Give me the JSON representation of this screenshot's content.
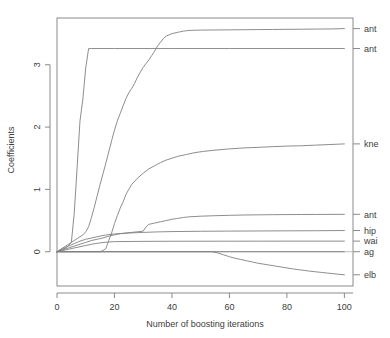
{
  "chart_data": {
    "type": "line",
    "title": "",
    "xlabel": "Number of boosting iterations",
    "ylabel": "Coefficients",
    "xlim": [
      0,
      103
    ],
    "ylim": [
      -0.55,
      3.75
    ],
    "xticks": [
      0,
      20,
      40,
      60,
      80,
      100
    ],
    "yticks": [
      0,
      1,
      2,
      3
    ],
    "xtick_labels": [
      "0",
      "20",
      "40",
      "60",
      "80",
      "100"
    ],
    "ytick_labels": [
      "0",
      "1",
      "2",
      "3"
    ],
    "grid": false,
    "legend_position": "right-axis-labels",
    "zero_reference_line": 0,
    "series": [
      {
        "name": "ant-upper",
        "label": "ant",
        "label_value": 3.58,
        "color": "#808080",
        "x": [
          0,
          1,
          2,
          3,
          4,
          5,
          6,
          7,
          8,
          9,
          10,
          11,
          12,
          13,
          14,
          15,
          16,
          17,
          18,
          19,
          20,
          21,
          22,
          23,
          24,
          25,
          26,
          27,
          28,
          29,
          30,
          31,
          32,
          33,
          34,
          35,
          36,
          37,
          38,
          39,
          40,
          41,
          42,
          43,
          44,
          45,
          46,
          47,
          48,
          50,
          55,
          60,
          65,
          70,
          75,
          80,
          85,
          90,
          95,
          100
        ],
        "y": [
          0,
          0.03,
          0.06,
          0.09,
          0.12,
          0.15,
          0.18,
          0.21,
          0.24,
          0.27,
          0.32,
          0.4,
          0.55,
          0.72,
          0.9,
          1.08,
          1.25,
          1.42,
          1.6,
          1.78,
          1.95,
          2.1,
          2.22,
          2.34,
          2.46,
          2.55,
          2.62,
          2.7,
          2.8,
          2.88,
          2.96,
          3.02,
          3.08,
          3.15,
          3.22,
          3.3,
          3.36,
          3.42,
          3.46,
          3.48,
          3.5,
          3.51,
          3.52,
          3.53,
          3.54,
          3.545,
          3.55,
          3.552,
          3.554,
          3.556,
          3.558,
          3.56,
          3.562,
          3.564,
          3.566,
          3.568,
          3.57,
          3.572,
          3.574,
          3.58
        ]
      },
      {
        "name": "ant-lower",
        "label": "ant",
        "label_value": 3.26,
        "color": "#808080",
        "x": [
          0,
          1,
          2,
          3,
          4,
          5,
          6,
          7,
          8,
          9,
          10,
          11,
          12,
          20,
          40,
          60,
          80,
          100
        ],
        "y": [
          0,
          0.02,
          0.04,
          0.06,
          0.1,
          0.15,
          0.62,
          1.35,
          2.1,
          2.45,
          2.95,
          3.26,
          3.26,
          3.26,
          3.26,
          3.26,
          3.26,
          3.26
        ]
      },
      {
        "name": "knee",
        "label": "kne",
        "label_value": 1.73,
        "color": "#808080",
        "x": [
          0,
          5,
          10,
          15,
          16,
          17,
          18,
          19,
          20,
          21,
          22,
          23,
          24,
          25,
          26,
          28,
          30,
          32,
          34,
          36,
          38,
          40,
          42,
          45,
          48,
          51,
          55,
          60,
          65,
          70,
          75,
          80,
          85,
          90,
          95,
          100
        ],
        "y": [
          0,
          0,
          0,
          0,
          0.02,
          0.05,
          0.18,
          0.3,
          0.45,
          0.58,
          0.7,
          0.8,
          0.92,
          1.0,
          1.08,
          1.18,
          1.26,
          1.33,
          1.38,
          1.43,
          1.47,
          1.5,
          1.53,
          1.56,
          1.59,
          1.61,
          1.63,
          1.65,
          1.665,
          1.675,
          1.685,
          1.695,
          1.7,
          1.71,
          1.72,
          1.73
        ]
      },
      {
        "name": "ant-small",
        "label": "ant",
        "label_value": 0.6,
        "color": "#808080",
        "x": [
          0,
          2,
          4,
          6,
          8,
          10,
          12,
          14,
          16,
          18,
          20,
          22,
          24,
          26,
          28,
          30,
          31,
          32,
          34,
          36,
          38,
          40,
          42,
          44,
          46,
          48,
          50,
          55,
          60,
          65,
          70,
          75,
          80,
          85,
          90,
          95,
          100
        ],
        "y": [
          0,
          0.03,
          0.06,
          0.09,
          0.12,
          0.15,
          0.18,
          0.2,
          0.22,
          0.25,
          0.27,
          0.29,
          0.3,
          0.31,
          0.32,
          0.33,
          0.4,
          0.44,
          0.46,
          0.48,
          0.5,
          0.52,
          0.535,
          0.55,
          0.56,
          0.565,
          0.57,
          0.578,
          0.584,
          0.589,
          0.592,
          0.594,
          0.596,
          0.597,
          0.598,
          0.599,
          0.6
        ]
      },
      {
        "name": "hip",
        "label": "hip",
        "label_value": 0.34,
        "color": "#808080",
        "x": [
          0,
          2,
          4,
          6,
          8,
          10,
          12,
          14,
          16,
          18,
          20,
          25,
          30,
          35,
          40,
          50,
          60,
          70,
          80,
          90,
          100
        ],
        "y": [
          0,
          0.05,
          0.09,
          0.13,
          0.17,
          0.2,
          0.22,
          0.24,
          0.26,
          0.275,
          0.285,
          0.3,
          0.31,
          0.318,
          0.323,
          0.328,
          0.331,
          0.333,
          0.335,
          0.337,
          0.34
        ]
      },
      {
        "name": "waist",
        "label": "wai",
        "label_value": 0.17,
        "color": "#808080",
        "x": [
          0,
          2,
          4,
          6,
          8,
          10,
          12,
          14,
          16,
          18,
          20,
          30,
          40,
          60,
          80,
          100
        ],
        "y": [
          0,
          0.02,
          0.04,
          0.06,
          0.08,
          0.1,
          0.12,
          0.135,
          0.148,
          0.156,
          0.162,
          0.166,
          0.168,
          0.169,
          0.17,
          0.17
        ]
      },
      {
        "name": "age",
        "label": "ag",
        "label_value": 0.0,
        "color": "#808080",
        "x": [
          0,
          100
        ],
        "y": [
          0,
          0
        ]
      },
      {
        "name": "elbow",
        "label": "elb",
        "label_value": -0.37,
        "color": "#808080",
        "x": [
          0,
          54,
          56,
          58,
          60,
          62,
          64,
          66,
          68,
          70,
          72,
          74,
          76,
          78,
          80,
          82,
          84,
          86,
          88,
          90,
          92,
          94,
          96,
          98,
          100
        ],
        "y": [
          0,
          0,
          -0.02,
          -0.05,
          -0.08,
          -0.105,
          -0.125,
          -0.145,
          -0.165,
          -0.185,
          -0.2,
          -0.215,
          -0.23,
          -0.245,
          -0.26,
          -0.275,
          -0.288,
          -0.3,
          -0.312,
          -0.322,
          -0.332,
          -0.342,
          -0.352,
          -0.362,
          -0.37
        ]
      }
    ]
  },
  "axis_labels": {
    "x_title": "Number of boosting iterations",
    "y_title": "Coefficients"
  }
}
